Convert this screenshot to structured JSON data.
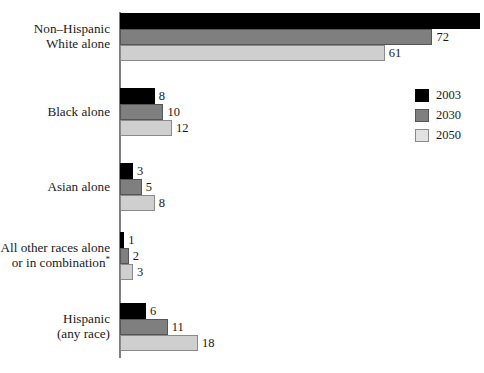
{
  "chart_data": {
    "type": "bar",
    "orientation": "horizontal",
    "title": "",
    "subtitle": "",
    "xlabel": "",
    "ylabel": "",
    "grid": false,
    "axis_ticks_visible": false,
    "xlim": [
      0,
      83
    ],
    "legend_position": "top-right",
    "categories": [
      "Non–Hispanic\nWhite alone",
      "Black alone",
      "Asian alone",
      "All other races alone\nor in combination*",
      "Hispanic\n(any race)"
    ],
    "series": [
      {
        "name": "2003",
        "color": "#000000",
        "values": [
          83,
          8,
          3,
          1,
          6
        ]
      },
      {
        "name": "2030",
        "color": "#7f7f7f",
        "values": [
          72,
          10,
          5,
          2,
          11
        ]
      },
      {
        "name": "2050",
        "color": "#cfcfcf",
        "values": [
          61,
          12,
          8,
          3,
          18
        ]
      }
    ],
    "value_labels": [
      [
        "83",
        "72",
        "61"
      ],
      [
        "8",
        "10",
        "12"
      ],
      [
        "3",
        "5",
        "8"
      ],
      [
        "1",
        "2",
        "3"
      ],
      [
        "6",
        "11",
        "18"
      ]
    ]
  },
  "legend": {
    "items": [
      {
        "label": "2003",
        "swatch": "black-swatch"
      },
      {
        "label": "2030",
        "swatch": "gray-swatch"
      },
      {
        "label": "2050",
        "swatch": "light-gray-swatch"
      }
    ]
  },
  "categories_display": [
    {
      "line1": "Non–Hispanic",
      "line2": "White alone",
      "footnote": ""
    },
    {
      "line1": "Black alone",
      "line2": "",
      "footnote": ""
    },
    {
      "line1": "Asian alone",
      "line2": "",
      "footnote": ""
    },
    {
      "line1": "All other races alone",
      "line2": "or in combination",
      "footnote": "*"
    },
    {
      "line1": "Hispanic",
      "line2": "(any race)",
      "footnote": ""
    }
  ],
  "colors": {
    "series_2003": "#000000",
    "series_2030": "#7f7f7f",
    "series_2050": "#cfcfcf",
    "axis": "#808080",
    "text": "#1a1a1a",
    "background": "#ffffff"
  }
}
